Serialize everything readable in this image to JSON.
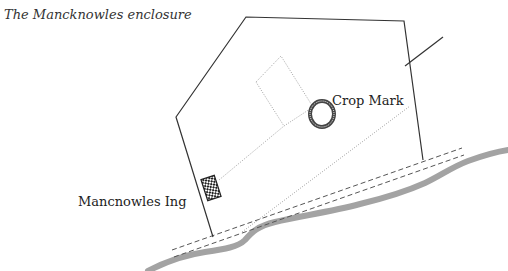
{
  "title": "The Mancknowles enclosure",
  "labels": {
    "crop_mark": "Crop Mark",
    "mancnowles_ing": "Mancnowles Ing"
  },
  "colors": {
    "outline": "#333333",
    "dotted": "#888888",
    "river": "#a0a0a0",
    "track": "#555555",
    "hatch": "#444444"
  },
  "features": [
    {
      "name": "enclosure-boundary",
      "kind": "solid polygon"
    },
    {
      "name": "boundary-spur",
      "kind": "solid line"
    },
    {
      "name": "inner-enclosure",
      "kind": "dotted rectangle"
    },
    {
      "name": "crop-mark",
      "kind": "hatched ring"
    },
    {
      "name": "mancnowles-ing-marker",
      "kind": "checkered rectangle"
    },
    {
      "name": "track",
      "kind": "double dashed line"
    },
    {
      "name": "river",
      "kind": "thick grey line"
    }
  ]
}
